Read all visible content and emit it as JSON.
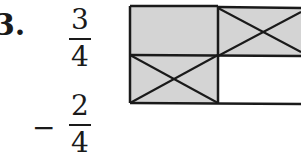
{
  "problem": {
    "number_label": "3.",
    "fraction1": {
      "numerator": "3",
      "denominator": "4"
    },
    "operator": "−",
    "fraction2": {
      "numerator": "2",
      "denominator": "4"
    }
  },
  "grid": {
    "rows": 2,
    "cols_visible": 2,
    "cells": [
      {
        "row": 0,
        "col": 0,
        "shaded": true,
        "crossed": false
      },
      {
        "row": 0,
        "col": 1,
        "shaded": true,
        "crossed": true
      },
      {
        "row": 1,
        "col": 0,
        "shaded": true,
        "crossed": true
      },
      {
        "row": 1,
        "col": 1,
        "shaded": false,
        "crossed": false
      }
    ],
    "shade_color": "#d4d4d4",
    "line_color": "#1a1a1a"
  }
}
